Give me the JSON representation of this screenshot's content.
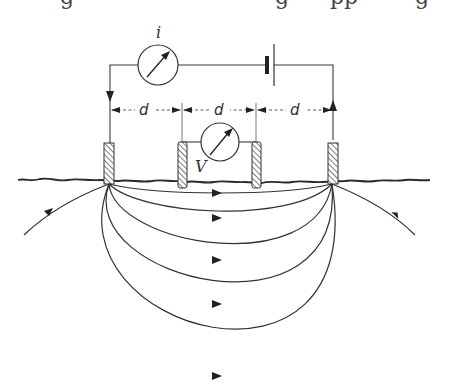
{
  "diagram": {
    "labels": {
      "current_meter": "i",
      "voltage_meter": "V",
      "spacing_1": "d",
      "spacing_2": "d",
      "spacing_3": "d"
    },
    "components": [
      {
        "name": "ammeter",
        "label": "i"
      },
      {
        "name": "battery",
        "label": ""
      },
      {
        "name": "voltmeter",
        "label": "V"
      },
      {
        "name": "current-electrode-left"
      },
      {
        "name": "potential-electrode-left"
      },
      {
        "name": "potential-electrode-right"
      },
      {
        "name": "current-electrode-right"
      }
    ],
    "electrode_spacing": "equal spacing d between adjacent electrodes",
    "field_lines": {
      "count_between_electrodes": 5,
      "outer_lines": 2,
      "direction": "left to right"
    },
    "colors": {
      "ink": "#333333",
      "background": "#ffffff"
    }
  }
}
